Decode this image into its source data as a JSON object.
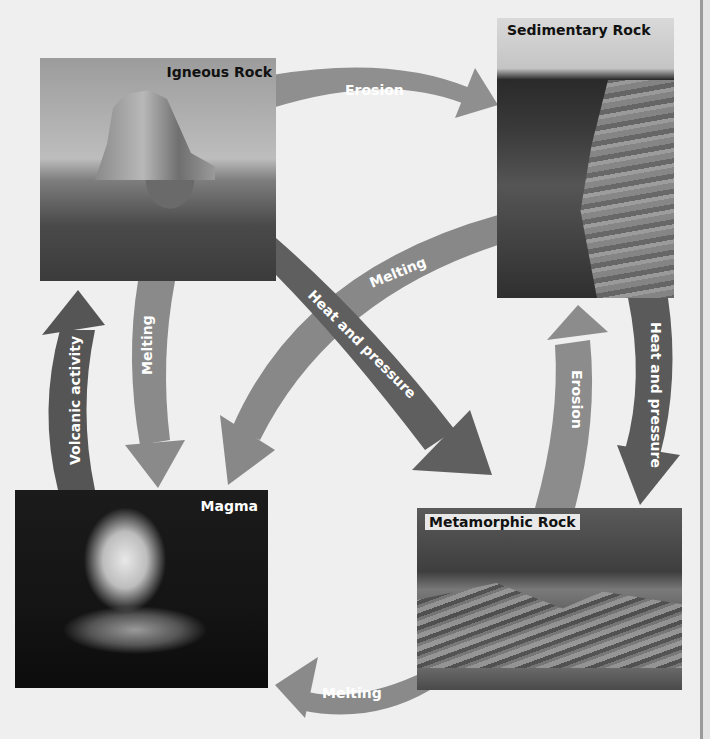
{
  "diagram": {
    "nodes": [
      {
        "id": "igneous",
        "label": "Igneous Rock",
        "image": "desert mesa / butte"
      },
      {
        "id": "sedimentary",
        "label": "Sedimentary Rock",
        "image": "layered canyon cliff"
      },
      {
        "id": "metamorphic",
        "label": "Metamorphic Rock",
        "image": "folded rock outcrop"
      },
      {
        "id": "magma",
        "label": "Magma",
        "image": "erupting volcano at night"
      }
    ],
    "arrows": [
      {
        "from": "igneous",
        "to": "sedimentary",
        "label": "Erosion",
        "color": "#8c8c8c"
      },
      {
        "from": "igneous",
        "to": "metamorphic",
        "label": "Heat and pressure",
        "color": "#5e5e5e"
      },
      {
        "from": "igneous",
        "to": "magma",
        "label": "Melting",
        "color": "#8a8a8a"
      },
      {
        "from": "sedimentary",
        "to": "magma",
        "label": "Melting",
        "color": "#8a8a8a"
      },
      {
        "from": "sedimentary",
        "to": "metamorphic",
        "label": "Heat and pressure",
        "color": "#5e5e5e"
      },
      {
        "from": "metamorphic",
        "to": "sedimentary",
        "label": "Erosion",
        "color": "#8c8c8c"
      },
      {
        "from": "metamorphic",
        "to": "magma",
        "label": "Melting",
        "color": "#8a8a8a"
      },
      {
        "from": "magma",
        "to": "igneous",
        "label": "Volcanic activity",
        "color": "#555555"
      }
    ]
  },
  "colors": {
    "background": "#efefef",
    "arrow_light": "#8c8c8c",
    "arrow_dark": "#5a5a5a",
    "label_text": "#111111",
    "arrow_text": "#ffffff"
  }
}
